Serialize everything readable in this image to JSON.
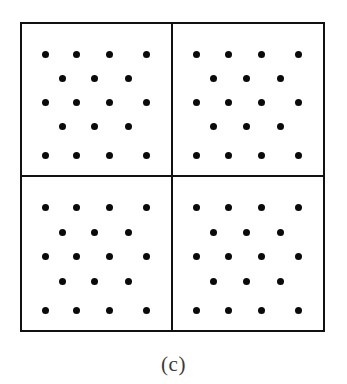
{
  "figure": {
    "caption": "(c)",
    "type": "lattice-point-diagram",
    "frame": {
      "x": 20,
      "y": 22,
      "width": 305,
      "height": 310,
      "border_color": "#111111",
      "border_width_px": 2,
      "background": "#ffffff"
    },
    "grid": {
      "rows": 2,
      "columns": 2,
      "cell_count": 4
    },
    "dot": {
      "color": "#0a0a0a",
      "diameter_px": 7,
      "shape": "circle"
    },
    "pattern_description": "staggered lattice, five rows of 4-3-4-3-4 dots",
    "dots_per_cell": 18,
    "dots_total": 72
  },
  "chart_data": {
    "type": "scatter",
    "title": "",
    "subtitle": "",
    "xlabel": "",
    "ylabel": "",
    "annotations": [
      "(c)"
    ],
    "legend": [],
    "grid": true,
    "axis_visible": false,
    "xlim": [
      0,
      100
    ],
    "ylim": [
      0,
      100
    ],
    "cells": [
      {
        "name": "top-left",
        "row": 0,
        "col": 0,
        "rows_of_dots": [
          4,
          3,
          4,
          3,
          4
        ],
        "points": [
          {
            "x": 16,
            "y": 20
          },
          {
            "x": 37,
            "y": 20
          },
          {
            "x": 59,
            "y": 20
          },
          {
            "x": 84,
            "y": 20
          },
          {
            "x": 27,
            "y": 36
          },
          {
            "x": 49,
            "y": 36
          },
          {
            "x": 72,
            "y": 36
          },
          {
            "x": 16,
            "y": 52
          },
          {
            "x": 37,
            "y": 52
          },
          {
            "x": 59,
            "y": 52
          },
          {
            "x": 84,
            "y": 52
          },
          {
            "x": 27,
            "y": 68
          },
          {
            "x": 49,
            "y": 68
          },
          {
            "x": 72,
            "y": 68
          },
          {
            "x": 16,
            "y": 87
          },
          {
            "x": 37,
            "y": 87
          },
          {
            "x": 59,
            "y": 87
          },
          {
            "x": 84,
            "y": 87
          }
        ]
      },
      {
        "name": "top-right",
        "row": 0,
        "col": 1,
        "rows_of_dots": [
          4,
          3,
          4,
          3,
          4
        ],
        "points": [
          {
            "x": 16,
            "y": 20
          },
          {
            "x": 37,
            "y": 20
          },
          {
            "x": 59,
            "y": 20
          },
          {
            "x": 84,
            "y": 20
          },
          {
            "x": 27,
            "y": 36
          },
          {
            "x": 49,
            "y": 36
          },
          {
            "x": 72,
            "y": 36
          },
          {
            "x": 16,
            "y": 52
          },
          {
            "x": 37,
            "y": 52
          },
          {
            "x": 59,
            "y": 52
          },
          {
            "x": 84,
            "y": 52
          },
          {
            "x": 27,
            "y": 68
          },
          {
            "x": 49,
            "y": 68
          },
          {
            "x": 72,
            "y": 68
          },
          {
            "x": 16,
            "y": 87
          },
          {
            "x": 37,
            "y": 87
          },
          {
            "x": 59,
            "y": 87
          },
          {
            "x": 84,
            "y": 87
          }
        ]
      },
      {
        "name": "bottom-left",
        "row": 1,
        "col": 0,
        "rows_of_dots": [
          4,
          3,
          4,
          3,
          4
        ],
        "points": [
          {
            "x": 16,
            "y": 20
          },
          {
            "x": 37,
            "y": 20
          },
          {
            "x": 59,
            "y": 20
          },
          {
            "x": 84,
            "y": 20
          },
          {
            "x": 27,
            "y": 36
          },
          {
            "x": 49,
            "y": 36
          },
          {
            "x": 72,
            "y": 36
          },
          {
            "x": 16,
            "y": 52
          },
          {
            "x": 37,
            "y": 52
          },
          {
            "x": 59,
            "y": 52
          },
          {
            "x": 84,
            "y": 52
          },
          {
            "x": 27,
            "y": 68
          },
          {
            "x": 49,
            "y": 68
          },
          {
            "x": 72,
            "y": 68
          },
          {
            "x": 16,
            "y": 87
          },
          {
            "x": 37,
            "y": 87
          },
          {
            "x": 59,
            "y": 87
          },
          {
            "x": 84,
            "y": 87
          }
        ]
      },
      {
        "name": "bottom-right",
        "row": 1,
        "col": 1,
        "rows_of_dots": [
          4,
          3,
          4,
          3,
          4
        ],
        "points": [
          {
            "x": 16,
            "y": 20
          },
          {
            "x": 37,
            "y": 20
          },
          {
            "x": 59,
            "y": 20
          },
          {
            "x": 84,
            "y": 20
          },
          {
            "x": 27,
            "y": 36
          },
          {
            "x": 49,
            "y": 36
          },
          {
            "x": 72,
            "y": 36
          },
          {
            "x": 16,
            "y": 52
          },
          {
            "x": 37,
            "y": 52
          },
          {
            "x": 59,
            "y": 52
          },
          {
            "x": 84,
            "y": 52
          },
          {
            "x": 27,
            "y": 68
          },
          {
            "x": 49,
            "y": 68
          },
          {
            "x": 72,
            "y": 68
          },
          {
            "x": 16,
            "y": 87
          },
          {
            "x": 37,
            "y": 87
          },
          {
            "x": 59,
            "y": 87
          },
          {
            "x": 84,
            "y": 87
          }
        ]
      }
    ]
  }
}
